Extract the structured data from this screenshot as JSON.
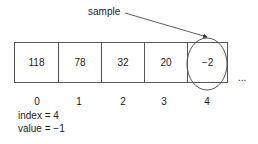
{
  "annotation": {
    "label": "sample"
  },
  "array": {
    "cells": [
      {
        "index": "0",
        "value": "118"
      },
      {
        "index": "1",
        "value": "78"
      },
      {
        "index": "2",
        "value": "32"
      },
      {
        "index": "3",
        "value": "20"
      },
      {
        "index": "4",
        "value": "−2"
      }
    ],
    "ellipsis": "..."
  },
  "state": {
    "index_line": "index = 4",
    "value_line": "value = −1"
  }
}
